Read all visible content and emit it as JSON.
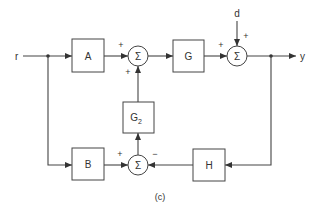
{
  "diagram": {
    "type": "block-diagram",
    "caption": "(c)",
    "signals": {
      "input": "r",
      "output": "y",
      "disturbance": "d"
    },
    "blocks": {
      "A": "A",
      "G": "G",
      "G2_base": "G",
      "G2_sub": "2",
      "B": "B",
      "H": "H"
    },
    "summing_symbol": "Σ",
    "signs": {
      "sum1_left": "+",
      "sum1_bottom": "+",
      "sum2_left": "+",
      "sum2_top": "+",
      "sum3_left": "+",
      "sum3_right": "−"
    },
    "connections": [
      {
        "from": "r",
        "to": "A"
      },
      {
        "from": "r",
        "to": "B"
      },
      {
        "from": "A",
        "to": "sum1",
        "sign": "+"
      },
      {
        "from": "G2",
        "to": "sum1",
        "sign": "+"
      },
      {
        "from": "sum1",
        "to": "G"
      },
      {
        "from": "G",
        "to": "sum2",
        "sign": "+"
      },
      {
        "from": "d",
        "to": "sum2",
        "sign": "+"
      },
      {
        "from": "sum2",
        "to": "y"
      },
      {
        "from": "y",
        "to": "H"
      },
      {
        "from": "B",
        "to": "sum3",
        "sign": "+"
      },
      {
        "from": "H",
        "to": "sum3",
        "sign": "−"
      },
      {
        "from": "sum3",
        "to": "G2"
      }
    ]
  }
}
